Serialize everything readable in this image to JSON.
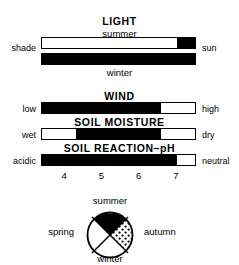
{
  "figure": {
    "background_color": "#ffffff",
    "ink_color": "#000000"
  },
  "sections": [
    {
      "id": "light",
      "title": "LIGHT",
      "sub_top": "summer",
      "sub_bottom": "winter",
      "left_label": "shade",
      "right_label": "sun",
      "bars": [
        {
          "id": "light-summer",
          "fill_start_pct": 88,
          "fill_end_pct": 100,
          "style": "outlined"
        },
        {
          "id": "light-winter",
          "fill_start_pct": 0,
          "fill_end_pct": 100,
          "style": "solid"
        }
      ]
    },
    {
      "id": "wind",
      "title": "WIND",
      "left_label": "low",
      "right_label": "high",
      "bars": [
        {
          "id": "wind-bar",
          "fill_start_pct": 0,
          "fill_end_pct": 78,
          "style": "outlined"
        }
      ]
    },
    {
      "id": "soil-moisture",
      "title": "SOIL MOISTURE",
      "left_label": "wet",
      "right_label": "dry",
      "bars": [
        {
          "id": "soil-moisture-bar",
          "fill_start_pct": 22,
          "fill_end_pct": 78,
          "style": "outlined"
        }
      ]
    },
    {
      "id": "soil-reaction",
      "title": "SOIL REACTION–pH",
      "left_label": "acidic",
      "right_label": "neutral",
      "bars": [
        {
          "id": "ph-bar",
          "fill_start_pct": 0,
          "fill_end_pct": 88,
          "style": "outlined"
        }
      ],
      "scale": {
        "ticks": [
          "4",
          "5",
          "6",
          "7"
        ],
        "positions_pct": [
          15,
          39,
          63,
          87
        ],
        "min": 4,
        "max": 7
      }
    }
  ],
  "season_circle": {
    "id": "flowering-season-circle",
    "labels": {
      "top": "summer",
      "right": "autumn",
      "bottom": "winter",
      "left": "spring"
    },
    "sectors": [
      {
        "name": "summer",
        "position": "top",
        "fill": "solid"
      },
      {
        "name": "autumn",
        "position": "right",
        "fill": "stippled"
      },
      {
        "name": "winter",
        "position": "bottom",
        "fill": "empty"
      },
      {
        "name": "spring",
        "position": "left",
        "fill": "empty"
      }
    ]
  }
}
